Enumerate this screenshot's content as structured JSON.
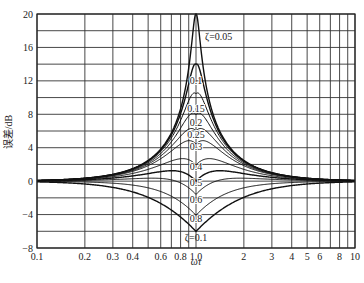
{
  "chart_data": {
    "type": "line",
    "title": "",
    "xlabel": "ωτ",
    "ylabel": "误差/dB",
    "xscale": "log",
    "xlim": [
      0.1,
      10
    ],
    "ylim": [
      -8,
      20
    ],
    "grid": true,
    "x_tick_labels": [
      "0.1",
      "0.2",
      "0.3",
      "0.4",
      "0.6",
      "0.8",
      "1.0",
      "2",
      "3",
      "4",
      "5",
      "6",
      "8",
      "10"
    ],
    "x_ticks": [
      0.1,
      0.2,
      0.3,
      0.4,
      0.6,
      0.8,
      1.0,
      2,
      3,
      4,
      5,
      6,
      8,
      10
    ],
    "x_gridlines": [
      0.1,
      0.2,
      0.3,
      0.4,
      0.5,
      0.6,
      0.7,
      0.8,
      0.9,
      1.0,
      2,
      3,
      4,
      5,
      6,
      7,
      8,
      9,
      10
    ],
    "y_ticks": [
      20,
      16,
      12,
      8,
      4,
      0,
      -4,
      -8
    ],
    "y_gridlines": [
      20,
      18,
      16,
      14,
      12,
      10,
      8,
      6,
      4,
      2,
      0,
      -2,
      -4,
      -6,
      -8
    ],
    "legend": "none (inline curve labels)",
    "series": [
      {
        "name": "ζ=0.05",
        "zeta": 0.05,
        "peak_db_at_1": 20.0,
        "label": "ζ=0.05"
      },
      {
        "name": "ζ=0.1",
        "zeta": 0.1,
        "peak_db_at_1": 13.98,
        "label": "0.1"
      },
      {
        "name": "ζ=0.15",
        "zeta": 0.15,
        "peak_db_at_1": 10.46,
        "label": "0.15"
      },
      {
        "name": "ζ=0.2",
        "zeta": 0.2,
        "peak_db_at_1": 7.96,
        "label": "0.2"
      },
      {
        "name": "ζ=0.25",
        "zeta": 0.25,
        "peak_db_at_1": 6.02,
        "label": "0.25"
      },
      {
        "name": "ζ=0.3",
        "zeta": 0.3,
        "peak_db_at_1": 4.44,
        "label": "0.3"
      },
      {
        "name": "ζ=0.4",
        "zeta": 0.4,
        "peak_db_at_1": 1.94,
        "label": "0.4"
      },
      {
        "name": "ζ=0.5",
        "zeta": 0.5,
        "peak_db_at_1": 0.0,
        "label": "0.5"
      },
      {
        "name": "ζ=0.6",
        "zeta": 0.6,
        "peak_db_at_1": -1.58,
        "label": "0.6"
      },
      {
        "name": "ζ=0.8",
        "zeta": 0.8,
        "peak_db_at_1": -4.08,
        "label": "0.8"
      },
      {
        "name": "ζ=1.0",
        "zeta": 1.0,
        "peak_db_at_1": -6.02,
        "label": "ζ=0.1"
      }
    ],
    "annotations": [
      "ζ=0.05",
      "0.1",
      "0.15",
      "0.2",
      "0.25",
      "0.3",
      "0.4",
      "0.5",
      "0.6",
      "0.8",
      "ζ=0.1"
    ]
  }
}
